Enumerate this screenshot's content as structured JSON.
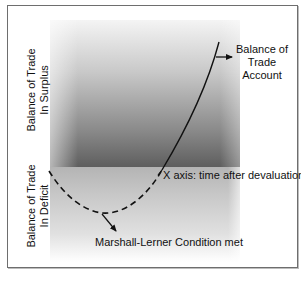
{
  "diagram": {
    "regions": {
      "surplus": {
        "label_line1": "Balance of Trade",
        "label_line2": "In Surplus"
      },
      "deficit": {
        "label_line1": "Balance of Trade",
        "label_line2": "In Deficit"
      }
    },
    "annotations": {
      "balance_of_trade_account": "Balance of Trade Account",
      "x_axis": "X axis: time after devaluation",
      "marshall_lerner": "Marshall-Lerner Condition met"
    },
    "colors": {
      "border": "#6e6e6e",
      "curve": "#111111",
      "surplus_gradient_top": "#f4f4f4",
      "surplus_gradient_bottom": "#5e5e5e",
      "deficit_gradient_top": "#b4b4b4",
      "deficit_gradient_bottom": "#ffffff"
    },
    "curve": {
      "dashed_segment": "below x-axis (deficit) from start, through minimum, back to x-axis",
      "solid_segment": "above x-axis (surplus) rising steeply"
    }
  }
}
